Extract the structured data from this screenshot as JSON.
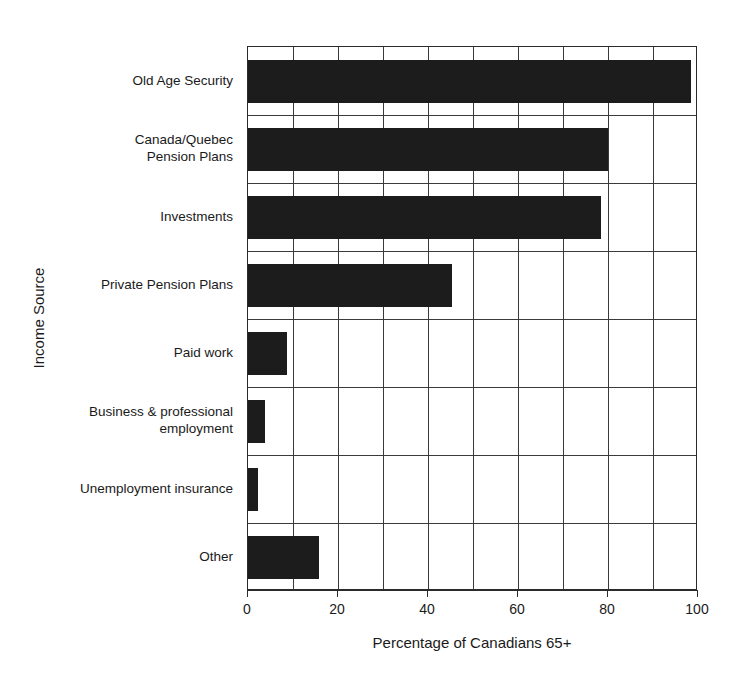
{
  "chart_data": {
    "type": "bar",
    "orientation": "horizontal",
    "title": "",
    "xlabel": "Percentage of Canadians 65+",
    "ylabel": "Income Source",
    "xlim": [
      0,
      100
    ],
    "xticks": [
      0,
      20,
      40,
      60,
      80,
      100
    ],
    "xtick_labels": [
      "0",
      "20",
      "40",
      "60",
      "80",
      "100"
    ],
    "minor_gridlines_every": 10,
    "grid": true,
    "legend": null,
    "bar_color": "#1c1c1c",
    "categories": [
      "Old Age Security",
      "Canada/Quebec\nPension Plans",
      "Investments",
      "Private Pension Plans",
      "Paid work",
      "Business & professional\nemployment",
      "Unemployment insurance",
      "Other"
    ],
    "values": [
      98.5,
      80,
      78.5,
      45.3,
      8.7,
      3.8,
      2.2,
      15.8
    ]
  },
  "axis": {
    "x_title": "Percentage of Canadians 65+",
    "y_title": "Income Source"
  }
}
